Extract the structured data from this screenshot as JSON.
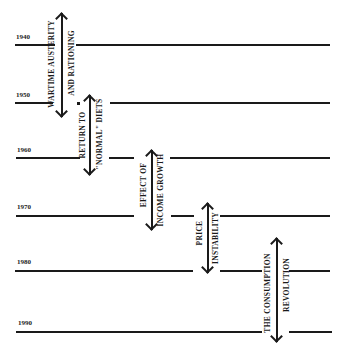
{
  "diagram": {
    "type": "timeline",
    "years": [
      "1940",
      "1950",
      "1960",
      "1970",
      "1980",
      "1990"
    ],
    "periods": [
      {
        "line1": "WARTIME AUSTERITY",
        "line2": "AND RATIONING",
        "from": "1937",
        "to": "1951"
      },
      {
        "line1": "RETURN TO",
        "line2": "\"NORMAL\" DIETS",
        "from": "1949",
        "to": "1962"
      },
      {
        "line1": "EFFECT OF",
        "line2": "INCOME GROWTH",
        "from": "1960",
        "to": "1973"
      },
      {
        "line1": "PRICE",
        "line2": "INSTABILITY",
        "from": "1970",
        "to": "1981"
      },
      {
        "line1": "THE CONSUMPTION",
        "line2": "REVOLUTION",
        "from": "1975",
        "to": "1992"
      }
    ]
  }
}
